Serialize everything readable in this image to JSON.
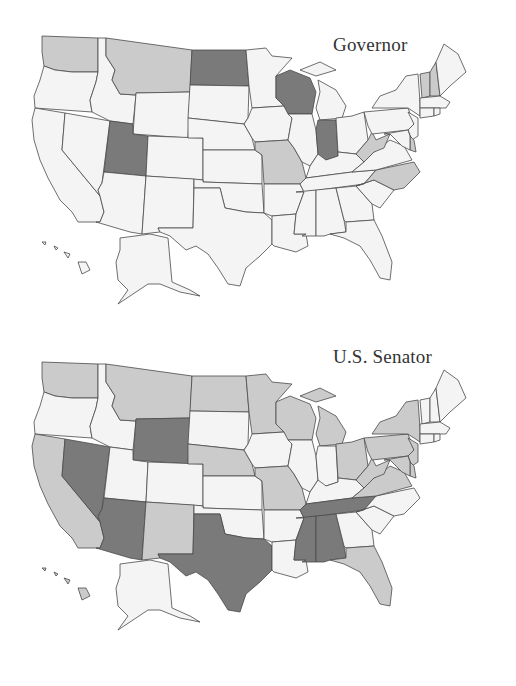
{
  "colors": {
    "none": "#f4f4f4",
    "light": "#cbcbcb",
    "dark": "#7a7a7a",
    "stroke": "#4a4a4a",
    "background": "#ffffff"
  },
  "maps": [
    {
      "id": "governor",
      "title": "Governor",
      "dark": [
        "ND",
        "UT",
        "WI",
        "IN"
      ],
      "light": [
        "WA",
        "MT",
        "MO",
        "WV",
        "NC",
        "VT",
        "NH",
        "DE"
      ]
    },
    {
      "id": "senator",
      "title": "U.S. Senator",
      "dark": [
        "NV",
        "WY",
        "AZ",
        "TX",
        "TN",
        "MS",
        "AL"
      ],
      "light": [
        "WA",
        "CA",
        "MT",
        "ND",
        "MN",
        "NE",
        "WI",
        "MI",
        "OH",
        "PA",
        "NY",
        "WV",
        "VA",
        "MD",
        "DE",
        "NJ",
        "MO",
        "NM",
        "FL",
        "HI"
      ]
    }
  ],
  "chart_data": [
    {
      "type": "choropleth",
      "title": "Governor",
      "categories": [
        "dark",
        "light",
        "none"
      ],
      "dark": [
        "North Dakota",
        "Utah",
        "Wisconsin",
        "Indiana"
      ],
      "light": [
        "Washington",
        "Montana",
        "Missouri",
        "West Virginia",
        "North Carolina",
        "Vermont",
        "New Hampshire",
        "Delaware"
      ]
    },
    {
      "type": "choropleth",
      "title": "U.S. Senator",
      "categories": [
        "dark",
        "light",
        "none"
      ],
      "dark": [
        "Nevada",
        "Wyoming",
        "Arizona",
        "Texas",
        "Tennessee",
        "Mississippi",
        "Alabama"
      ],
      "light": [
        "Washington",
        "California",
        "Montana",
        "North Dakota",
        "Minnesota",
        "Nebraska",
        "Wisconsin",
        "Michigan",
        "Ohio",
        "Pennsylvania",
        "New York",
        "West Virginia",
        "Virginia",
        "Maryland",
        "Delaware",
        "New Jersey",
        "Missouri",
        "New Mexico",
        "Florida",
        "Hawaii"
      ]
    }
  ]
}
